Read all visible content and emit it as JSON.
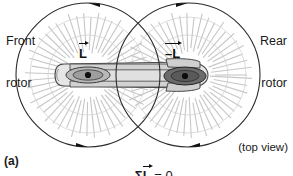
{
  "figure": {
    "panel_label": "(a)",
    "view_note": "(top view)",
    "equation": {
      "sigma": "Σ",
      "symbol": "L",
      "rest": " = 0",
      "full_text": "ΣL⃗ = 0"
    },
    "labels": {
      "front_rotor_line1": "Front",
      "front_rotor_line2": "rotor",
      "rear_rotor_line1": "Rear",
      "rear_rotor_line2": "rotor",
      "vector_left": "L",
      "vector_right": "–L"
    },
    "colors": {
      "ink": "#1a1a1a",
      "stroke": "#333333",
      "rotor_disc_edge": "#555555",
      "body_fill": "#d9d9d9",
      "body_fill_light": "#eaeaea",
      "hub_fill": "#a8a8a8",
      "hub_dark_fill": "#6e6e6e",
      "hub_dot": "#111111",
      "background": "#ffffff"
    },
    "geometry": {
      "front_rotor_center_x": 88,
      "front_rotor_center_y": 75,
      "front_rotor_radius": 72,
      "rear_rotor_center_x": 188,
      "rear_rotor_center_y": 75,
      "rear_rotor_radius": 72,
      "front_rotation": "counterclockwise",
      "rear_rotation": "clockwise"
    }
  }
}
